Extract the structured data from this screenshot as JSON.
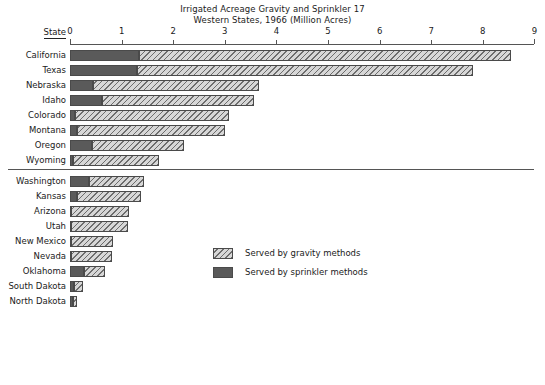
{
  "chart_data": {
    "type": "bar",
    "orientation": "horizontal",
    "stacked": true,
    "title": "Irrigated Acreage Gravity and Sprinkler 17",
    "subtitle": "Western States, 1966 (Million Acres)",
    "xlabel": "",
    "ylabel": "State",
    "category_header": "State",
    "xlim": [
      0,
      9
    ],
    "xticks": [
      0,
      1,
      2,
      3,
      4,
      5,
      6,
      7,
      8,
      9
    ],
    "xtick_labels": [
      "0",
      "1",
      "2",
      "3",
      "4",
      "5",
      "6",
      "7",
      "8",
      "9"
    ],
    "grid": false,
    "legend_position": "center",
    "categories": [
      "California",
      "Texas",
      "Nebraska",
      "Idaho",
      "Colorado",
      "Montana",
      "Oregon",
      "Wyoming",
      "Washington",
      "Kansas",
      "Arizona",
      "Utah",
      "New Mexico",
      "Nevada",
      "Oklahoma",
      "South Dakota",
      "North Dakota"
    ],
    "group_break_after": "Wyoming",
    "series": [
      {
        "name": "Served by sprinkler methods",
        "key": "sprinkler",
        "color": "#5a5a5a",
        "fill": "solid",
        "values": [
          1.33,
          1.3,
          0.45,
          0.62,
          0.1,
          0.13,
          0.43,
          0.06,
          0.36,
          0.13,
          0.02,
          0.02,
          0.02,
          0.02,
          0.27,
          0.08,
          0.06
        ]
      },
      {
        "name": "Served by gravity methods",
        "key": "gravity",
        "color": "#d7d7d7",
        "fill": "hatched",
        "values": [
          7.21,
          6.51,
          3.22,
          2.95,
          2.98,
          2.87,
          1.77,
          1.67,
          1.07,
          1.24,
          1.12,
          1.1,
          0.82,
          0.8,
          0.4,
          0.18,
          0.08
        ]
      }
    ],
    "totals": [
      8.54,
      7.81,
      3.67,
      3.57,
      3.08,
      3.0,
      2.2,
      1.73,
      1.43,
      1.37,
      1.14,
      1.12,
      0.84,
      0.82,
      0.67,
      0.26,
      0.14
    ],
    "legend": [
      {
        "label": "Served by gravity methods",
        "swatch": "gravity"
      },
      {
        "label": "Served by sprinkler methods",
        "swatch": "sprinkler"
      }
    ]
  }
}
